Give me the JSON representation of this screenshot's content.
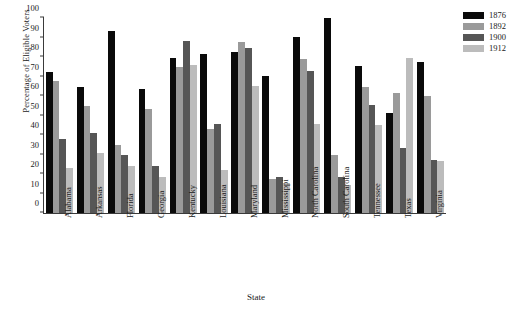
{
  "chart_data": {
    "type": "bar",
    "title": "",
    "xlabel": "State",
    "ylabel": "Percentage of Eligible Voters",
    "ylim": [
      0,
      100
    ],
    "yticks": [
      0,
      10,
      20,
      30,
      40,
      50,
      60,
      70,
      80,
      90,
      100
    ],
    "ytick_labels": [
      "0",
      "10",
      "20",
      "30",
      "40",
      "50",
      "60",
      "70",
      "80",
      "90",
      "100"
    ],
    "grid": false,
    "legend_position": "top-right",
    "categories": [
      "Alabama",
      "Arkansas",
      "Florida",
      "Georgia",
      "Kentucky",
      "Louisiana",
      "Maryland",
      "Mississippi",
      "North Carolina",
      "South Carolina",
      "Tennessee",
      "Texas",
      "Virginia"
    ],
    "series": [
      {
        "name": "1876",
        "color": "#0a0a0a",
        "values": [
          72.5,
          64.5,
          93.5,
          63.5,
          79.5,
          81.5,
          82.5,
          70.5,
          90.5,
          100.0,
          75.5,
          51.5,
          77.5
        ]
      },
      {
        "name": "1892",
        "color": "#9a9a9a",
        "values": [
          67.5,
          55.0,
          35.0,
          53.5,
          75.0,
          43.0,
          87.5,
          17.5,
          79.0,
          29.5,
          64.5,
          61.5,
          60.0
        ]
      },
      {
        "name": "1900",
        "color": "#565656",
        "values": [
          38.0,
          41.0,
          30.0,
          24.0,
          88.0,
          45.5,
          84.5,
          18.5,
          73.0,
          18.5,
          55.5,
          33.5,
          27.0
        ]
      },
      {
        "name": "1912",
        "color": "#bcbcbc",
        "values": [
          23.0,
          31.0,
          24.0,
          18.5,
          76.0,
          22.0,
          65.0,
          15.5,
          45.5,
          14.5,
          45.0,
          79.5,
          26.5
        ]
      }
    ]
  }
}
